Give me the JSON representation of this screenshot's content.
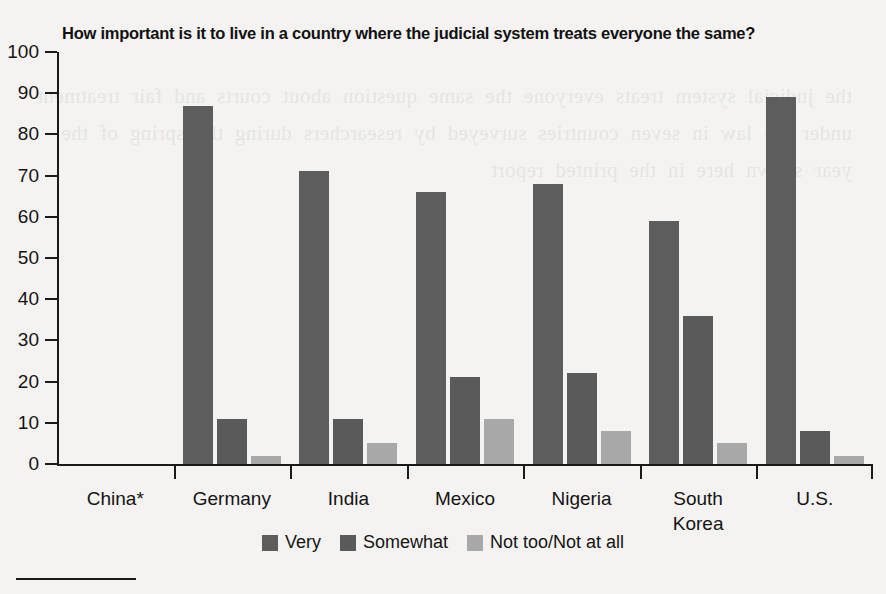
{
  "chart_data": {
    "type": "bar",
    "title": "How important is it to live in a country where the judicial system treats everyone the same?",
    "xlabel": "",
    "ylabel": "",
    "ylim": [
      0,
      100
    ],
    "yticks": [
      0,
      10,
      20,
      30,
      40,
      50,
      60,
      70,
      80,
      90,
      100
    ],
    "grid": false,
    "legend_position": "bottom-center",
    "categories": [
      "China*",
      "Germany",
      "India",
      "Mexico",
      "Nigeria",
      "South\nKorea",
      "U.S."
    ],
    "series": [
      {
        "name": "Very",
        "color": "#5d5d5d",
        "values": [
          null,
          87,
          71,
          66,
          68,
          59,
          89
        ]
      },
      {
        "name": "Somewhat",
        "color": "#5a5a5a",
        "values": [
          null,
          11,
          11,
          21,
          22,
          36,
          8
        ]
      },
      {
        "name": "Not too/Not at all",
        "color": "#a8a8a8",
        "values": [
          null,
          2,
          5,
          11,
          8,
          5,
          2
        ]
      }
    ]
  },
  "bleed_text": "the judicial system treats everyone the same question about courts and fair treatment under the law in seven countries surveyed by researchers during the spring of the year shown here in the printed report"
}
